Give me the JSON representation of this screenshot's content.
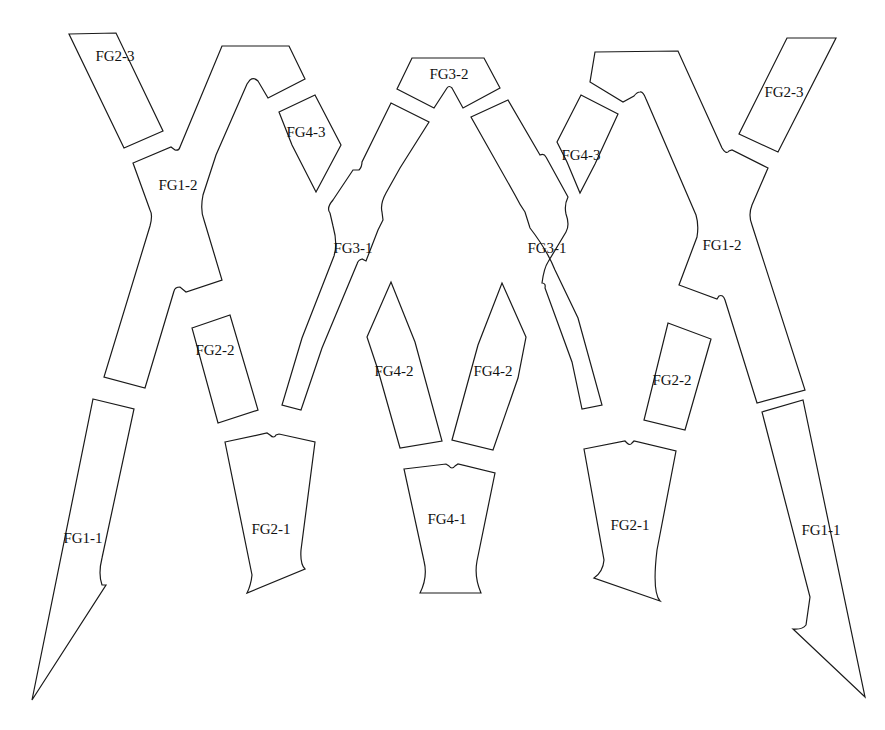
{
  "diagram": {
    "type": "pattern-pieces",
    "colors": {
      "stroke": "#1a1a1a",
      "background": "#ffffff",
      "text": "#111111"
    },
    "pieces": [
      {
        "id": "fg2-3-left",
        "label": "FG2-3",
        "lx": 115,
        "ly": 85
      },
      {
        "id": "fg1-2-left",
        "label": "FG1-2",
        "lx": 178,
        "ly": 190
      },
      {
        "id": "fg4-3-left",
        "label": "FG4-3",
        "lx": 308,
        "ly": 135
      },
      {
        "id": "fg3-2",
        "label": "FG3-2",
        "lx": 443,
        "ly": 78
      },
      {
        "id": "fg3-1-left",
        "label": "FG3-1",
        "lx": 353,
        "ly": 250
      },
      {
        "id": "fg3-1-right",
        "label": "FG3-1",
        "lx": 546,
        "ly": 250
      },
      {
        "id": "fg4-3-right",
        "label": "FG4-3",
        "lx": 580,
        "ly": 160
      },
      {
        "id": "fg2-3-right",
        "label": "FG2-3",
        "lx": 784,
        "ly": 95
      },
      {
        "id": "fg1-2-right",
        "label": "FG1-2",
        "lx": 722,
        "ly": 248
      },
      {
        "id": "fg2-2-left",
        "label": "FG2-2",
        "lx": 215,
        "ly": 355
      },
      {
        "id": "fg4-2-left",
        "label": "FG4-2",
        "lx": 393,
        "ly": 372
      },
      {
        "id": "fg4-2-right",
        "label": "FG4-2",
        "lx": 493,
        "ly": 372
      },
      {
        "id": "fg2-2-right",
        "label": "FG2-2",
        "lx": 672,
        "ly": 382
      },
      {
        "id": "fg1-1-left",
        "label": "FG1-1",
        "lx": 83,
        "ly": 540
      },
      {
        "id": "fg2-1-left",
        "label": "FG2-1",
        "lx": 270,
        "ly": 530
      },
      {
        "id": "fg4-1",
        "label": "FG4-1",
        "lx": 447,
        "ly": 522
      },
      {
        "id": "fg2-1-right",
        "label": "FG2-1",
        "lx": 630,
        "ly": 527
      },
      {
        "id": "fg1-1-right",
        "label": "FG1-1",
        "lx": 822,
        "ly": 532
      }
    ]
  }
}
